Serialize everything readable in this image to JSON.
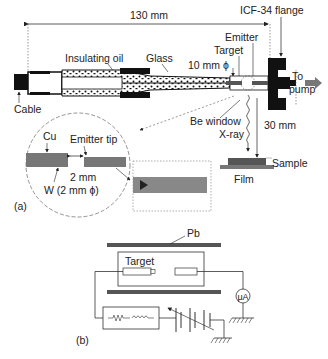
{
  "figure": {
    "panel_a": {
      "panel_label": "(a)",
      "dimension_length": "130 mm",
      "labels": {
        "flange": "ICF-34 flange",
        "insulating_oil": "Insulating oil",
        "glass": "Glass",
        "emitter": "Emitter",
        "target": "Target",
        "diameter": "10 mm ϕ",
        "to": "To",
        "pump": "pump",
        "cable": "Cable",
        "be_window": "Be window",
        "xray": "X-ray",
        "distance": "30 mm",
        "sample": "Sample",
        "film": "Film"
      },
      "inset": {
        "cu": "Cu",
        "emitter_tip": "Emitter tip",
        "gap": "2 mm",
        "w": "W (2 mm ϕ)"
      }
    },
    "panel_b": {
      "panel_label": "(b)",
      "labels": {
        "pb": "Pb",
        "target": "Target",
        "ammeter": "μA"
      }
    }
  }
}
